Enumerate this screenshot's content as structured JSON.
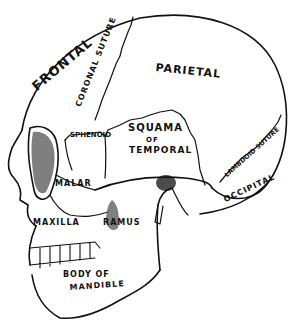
{
  "diagram": {
    "colors": {
      "ink": "#111111",
      "background": "#ffffff",
      "shade": "#555555"
    },
    "labels": {
      "frontal": "FRONTAL",
      "coronal_suture": "CORONAL SUTURE",
      "parietal": "PARIETAL",
      "sphenoid": "SPHENOID",
      "squama": "SQUAMA",
      "of": "OF",
      "temporal": "TEMPORAL",
      "lambdoid_suture": "LAMBDOID SUTURE",
      "occipital": "OCCIPITAL",
      "malar": "MALAR",
      "maxilla": "MAXILLA",
      "ramus": "RAMUS",
      "body_of": "BODY OF",
      "mandible": "MANDIBLE"
    }
  }
}
